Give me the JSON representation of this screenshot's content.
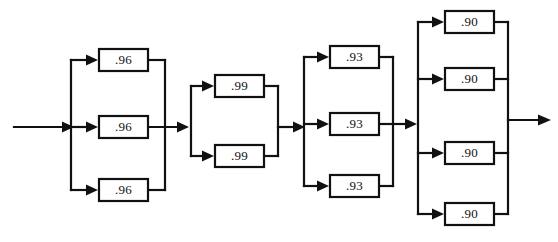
{
  "diagram": {
    "type": "reliability-block-diagram",
    "background_color": "#ffffff",
    "line_color": "#111111",
    "block_fill": "#ffffff",
    "input_arrow": "input-arrow",
    "output_arrow": "output-arrow",
    "stages": [
      {
        "name": "stage-1",
        "configuration": "parallel",
        "count": 3,
        "blocks": [
          {
            "label": ".96",
            "value": 0.96
          },
          {
            "label": ".96",
            "value": 0.96
          },
          {
            "label": ".96",
            "value": 0.96
          }
        ]
      },
      {
        "name": "stage-2",
        "configuration": "parallel",
        "count": 2,
        "blocks": [
          {
            "label": ".99",
            "value": 0.99
          },
          {
            "label": ".99",
            "value": 0.99
          }
        ]
      },
      {
        "name": "stage-3",
        "configuration": "parallel",
        "count": 3,
        "blocks": [
          {
            "label": ".93",
            "value": 0.93
          },
          {
            "label": ".93",
            "value": 0.93
          },
          {
            "label": ".93",
            "value": 0.93
          }
        ]
      },
      {
        "name": "stage-4",
        "configuration": "parallel",
        "count": 4,
        "blocks": [
          {
            "label": ".90",
            "value": 0.9
          },
          {
            "label": ".90",
            "value": 0.9
          },
          {
            "label": ".90",
            "value": 0.9
          },
          {
            "label": ".90",
            "value": 0.9
          }
        ]
      }
    ]
  }
}
